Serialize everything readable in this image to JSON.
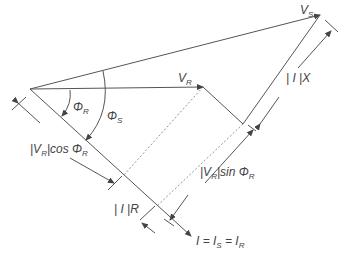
{
  "diagram": {
    "labels": {
      "vs": {
        "main": "V",
        "sub": "S"
      },
      "vr": {
        "main": "V",
        "sub": "R"
      },
      "phi_r": {
        "main": "Φ",
        "sub": "R"
      },
      "phi_s": {
        "main": "Φ",
        "sub": "S"
      },
      "ix": "| I |X",
      "ir": "| I |R",
      "vr_cos": {
        "pre": "|V",
        "sub": "R",
        "post": "|cos Φ",
        "sub2": "R"
      },
      "vr_sin": {
        "pre": "|V",
        "sub": "R",
        "post": "|sin Φ",
        "sub2": "R"
      },
      "current": {
        "a": "I = I",
        "sub1": "S",
        "b": " = I",
        "sub2": "R"
      }
    },
    "points": {
      "origin": [
        30,
        89
      ],
      "vr_tip": [
        203,
        87
      ],
      "ir_end": [
        243,
        124
      ],
      "vs_tip": [
        320,
        15
      ],
      "i_tip": [
        191,
        236
      ]
    },
    "colors": {
      "line": "#555555",
      "text": "#444444",
      "background": "#ffffff"
    }
  }
}
